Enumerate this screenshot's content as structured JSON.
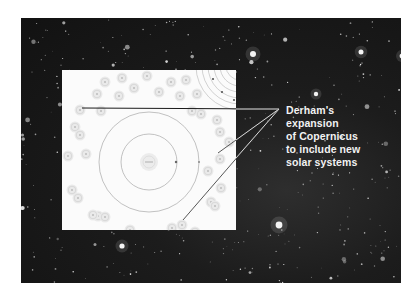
{
  "caption": {
    "lines": [
      "Derham's",
      "expansion",
      "of Copernicus",
      "to include new",
      "solar systems"
    ]
  },
  "colors": {
    "background": "#ffffff",
    "space": "#161616",
    "inset_paper": "#fbfbfb",
    "orbit_line": "#9a9a9a",
    "pointer_line": "#e8e8e8",
    "caption_text": "#f2f2f2"
  },
  "diagram": {
    "central_system": {
      "orbits": 2,
      "planets_marked": 2
    },
    "neighbor_systems_shown": true,
    "pointer_lines": 3
  }
}
